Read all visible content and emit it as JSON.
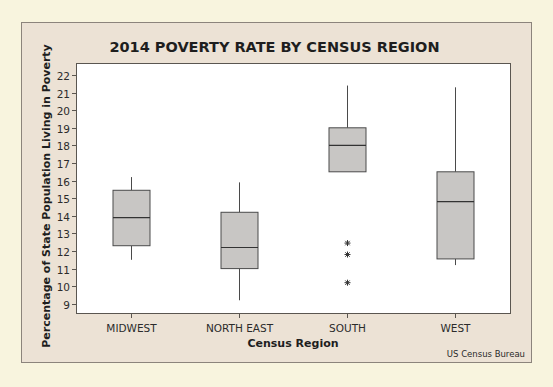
{
  "chart_data": {
    "type": "box",
    "title": "2014 POVERTY RATE BY CENSUS REGION",
    "xlabel": "Census Region",
    "ylabel": "Percentage of State Population Living in Poverty",
    "source_note": "US Census Bureau",
    "categories": [
      "MIDWEST",
      "NORTH EAST",
      "SOUTH",
      "WEST"
    ],
    "ylim": [
      8.5,
      22.7
    ],
    "yticks": [
      9,
      10,
      11,
      12,
      13,
      14,
      15,
      16,
      17,
      18,
      19,
      20,
      21,
      22
    ],
    "grid": false,
    "legend": null,
    "series": [
      {
        "name": "MIDWEST",
        "whisker_low": 11.5,
        "q1": 12.3,
        "median": 13.9,
        "q3": 15.45,
        "whisker_high": 16.2,
        "outliers": []
      },
      {
        "name": "NORTH EAST",
        "whisker_low": 9.2,
        "q1": 11.0,
        "median": 12.2,
        "q3": 14.2,
        "whisker_high": 15.9,
        "outliers": []
      },
      {
        "name": "SOUTH",
        "whisker_low": 16.5,
        "q1": 16.5,
        "median": 18.0,
        "q3": 19.0,
        "whisker_high": 21.4,
        "outliers": [
          12.45,
          11.8,
          10.2
        ]
      },
      {
        "name": "WEST",
        "whisker_low": 11.2,
        "q1": 11.55,
        "median": 14.8,
        "q3": 16.5,
        "whisker_high": 21.3,
        "outliers": []
      }
    ],
    "colors": {
      "box_fill": "#c8c6c4",
      "box_stroke": "#4a4a4a",
      "plot_bg": "#ffffff",
      "panel_bg": "#ece2d5",
      "page_bg": "#f8f4de"
    }
  }
}
